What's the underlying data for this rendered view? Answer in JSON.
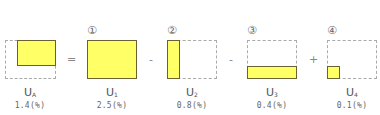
{
  "terms": [
    {
      "id": "UA",
      "marker": "",
      "label": "U",
      "sub": "A",
      "value": "1.4(%)"
    },
    {
      "id": "U1",
      "marker": "①",
      "label": "U",
      "sub": "1",
      "value": "2.5(%)"
    },
    {
      "id": "U2",
      "marker": "②",
      "label": "U",
      "sub": "2",
      "value": "0.8(%)"
    },
    {
      "id": "U3",
      "marker": "③",
      "label": "U",
      "sub": "3",
      "value": "0.4(%)"
    },
    {
      "id": "U4",
      "marker": "④",
      "label": "U",
      "sub": "4",
      "value": "0.1(%)"
    }
  ],
  "operators": [
    "=",
    "-",
    "-",
    "+"
  ],
  "colors": {
    "fill": "#ffff66",
    "fill_border": "#6b6030",
    "dashed": "#aaaaaa"
  }
}
